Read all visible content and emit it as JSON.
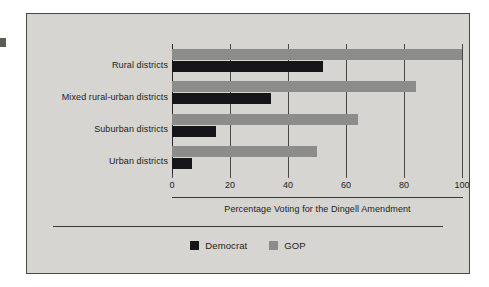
{
  "figure": {
    "background_color": "#d6d5d1",
    "frame_border_color": "#4a4846",
    "edge_mark_name": "page-edge-mark"
  },
  "legend": {
    "position": "bottom-center",
    "items": [
      {
        "label": "Democrat",
        "color": "#16161a",
        "swatch": "dem"
      },
      {
        "label": "GOP",
        "color": "#8c8c8a",
        "swatch": "gop"
      }
    ]
  },
  "chart_data": {
    "type": "bar",
    "orientation": "horizontal",
    "title": "",
    "subtitle": "",
    "xlabel": "Percentage Voting for the Dingell Amendment",
    "ylabel": "",
    "categories": [
      "Rural districts",
      "Mixed rural-urban districts",
      "Suburban districts",
      "Urban districts"
    ],
    "series": [
      {
        "name": "GOP",
        "color": "#8c8c8a",
        "values": [
          100,
          84,
          64,
          50
        ]
      },
      {
        "name": "Democrat",
        "color": "#16161a",
        "values": [
          52,
          34,
          15,
          7
        ]
      }
    ],
    "xlim": [
      0,
      100
    ],
    "xticks": [
      0,
      20,
      40,
      60,
      80,
      100
    ],
    "xtick_labels": [
      "0",
      "20",
      "40",
      "60",
      "80",
      "100"
    ],
    "grid": true,
    "grid_axis": "x",
    "legend_position": "bottom-center"
  }
}
